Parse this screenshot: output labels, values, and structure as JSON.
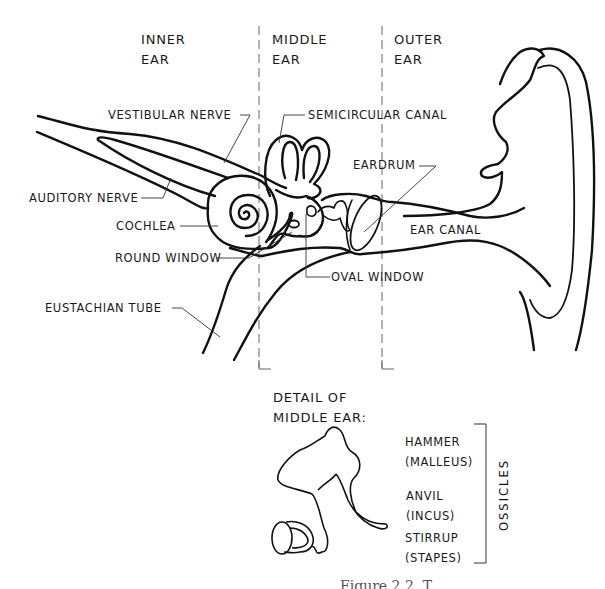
{
  "section_headers": {
    "inner": "INNER\nEAR",
    "middle": "MIDDLE\nEAR",
    "outer": "OUTER\nEAR"
  },
  "labels": {
    "vestibular_nerve": "VESTIBULAR NERVE",
    "semicircular_canal": "SEMICIRCULAR CANAL",
    "auditory_nerve": "AUDITORY NERVE",
    "eardrum": "EARDRUM",
    "cochlea": "COCHLEA",
    "ear_canal": "EAR CANAL",
    "round_window": "ROUND WINDOW",
    "oval_window": "OVAL WINDOW",
    "eustachian_tube": "EUSTACHIAN TUBE"
  },
  "detail": {
    "title": "DETAIL OF\nMIDDLE EAR:",
    "ossicles": [
      {
        "name": "HAMMER\n (MALLEUS)"
      },
      {
        "name": "ANVIL\n (INCUS)"
      },
      {
        "name": "STIRRUP\n (STAPES)"
      }
    ],
    "group_label": "OSSICLES"
  },
  "caption": "Figure 2.2. T",
  "colors": {
    "line": "#111111",
    "leader": "#333333",
    "divider": "#666666",
    "background": "#ffffff"
  }
}
